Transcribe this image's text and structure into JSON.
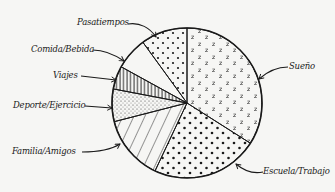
{
  "chart_data": {
    "type": "pie",
    "title": "",
    "style": "hand-drawn, black ink on off-white, pattern fills",
    "start_angle_deg": 90,
    "direction": "clockwise",
    "slices": [
      {
        "label": "Sueño",
        "value": 34,
        "pattern": "z-letters"
      },
      {
        "label": "Escuela/Trabajo",
        "value": 23,
        "pattern": "heart-dots"
      },
      {
        "label": "Familia/Amigos",
        "value": 14,
        "pattern": "diagonal-hatch"
      },
      {
        "label": "Deporte/Ejercicio",
        "value": 7,
        "pattern": "fine-dots"
      },
      {
        "label": "Viajes",
        "value": 5,
        "pattern": "vertical-hatch"
      },
      {
        "label": "Comida/Bebida",
        "value": 7,
        "pattern": "blank"
      },
      {
        "label": "Pasatiempos",
        "value": 10,
        "pattern": "large-dots"
      }
    ],
    "legend": "none (arrow annotations)",
    "colors": {
      "ink": "#1a1a1a",
      "background": "#f6f6f4"
    }
  },
  "labels": {
    "pasatiempos": "Pasatiempos",
    "comida": "Comida/Bebida",
    "viajes": "Viajes",
    "deporte": "Deporte/Ejercicio",
    "familia": "Familia/Amigos",
    "sueno": "Sueño",
    "escuela": "Escuela/Trabajo"
  }
}
